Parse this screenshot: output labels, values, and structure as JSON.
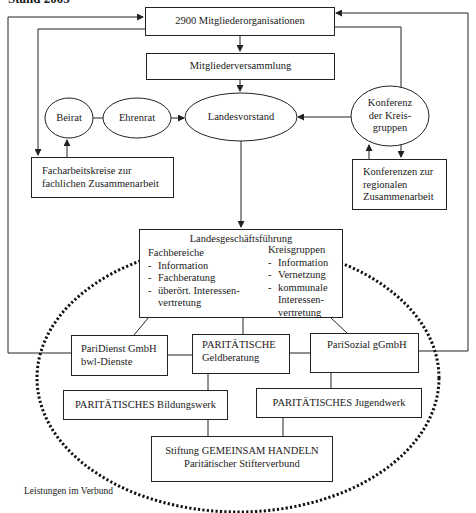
{
  "diagram": {
    "title": "Stand 2005",
    "top_boxes": {
      "member_orgs": "2900 Mitgliederorganisationen",
      "assembly": "Mitgliederversammlung"
    },
    "ellipses": {
      "beirat": "Beirat",
      "ehrenrat": "Ehrenrat",
      "landesvorstand": "Landesvorstand",
      "konferenz_kreisgruppen": [
        "Konferenz",
        "der Kreis-",
        "gruppen"
      ]
    },
    "side_boxes": {
      "facharbeitskreise": [
        "Facharbeitskreise zur",
        "fachlichen Zusammenarbeit"
      ],
      "konferenzen_regional": [
        "Konferenzen zur",
        "regionalen",
        "Zusammenarbeit"
      ]
    },
    "landesgeschaeftsfuehrung": {
      "title": "Landesgeschäftsführung",
      "fachbereiche": {
        "heading": "Fachbereiche",
        "items": [
          "Information",
          "Fachberatung",
          "überört. Interessen-",
          "vertretung"
        ]
      },
      "kreisgruppen": {
        "heading": "Kreisgruppen",
        "items": [
          "Information",
          "Vernetzung",
          "kommunale",
          "Interessen-",
          "vertretung"
        ]
      }
    },
    "subsidiaries": {
      "paridienst": [
        "PariDienst GmbH",
        "bwl-Dienste"
      ],
      "geldberatung": [
        "PARITÄTISCHE",
        "Geldberatung"
      ],
      "parisozial": "PariSozial gGmbH",
      "bildungswerk": "PARITÄTISCHES Bildungswerk",
      "jugendwerk": "PARITÄTISCHES Jugendwerk",
      "stiftung": [
        "Stiftung GEMEINSAM HANDELN",
        "Paritätischer Stifterverbund"
      ]
    },
    "footer_label": "Leistungen im Verbund",
    "colors": {
      "line": "#222222",
      "dotted_ellipse": "#111111",
      "background": "#ffffff"
    }
  }
}
